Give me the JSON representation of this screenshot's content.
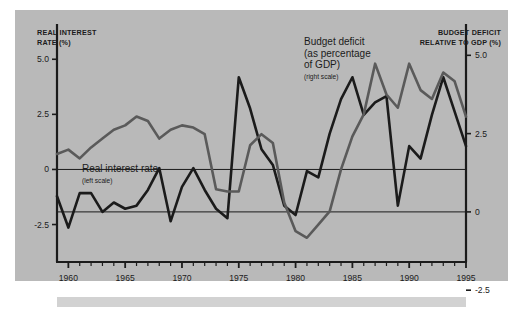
{
  "figure": {
    "background_color": "#b9b9b9",
    "page_color": "#ffffff",
    "underbar_color": "#d2d2d2"
  },
  "axis_titles": {
    "left": "REAL INTEREST\nRATE (%)",
    "right": "BUDGET DEFICIT\nRELATIVE TO GDP (%)"
  },
  "annotations": {
    "deficit": {
      "main": "Budget deficit\n(as percentage\nof GDP)",
      "sub": "(right scale)"
    },
    "interest": {
      "main": "Real interest rate",
      "sub": "(left scale)"
    }
  },
  "chart_data": {
    "type": "line",
    "title": "",
    "subtitle": "",
    "xlabel": "",
    "ylabel": "REAL INTEREST RATE (%)",
    "y2label": "BUDGET DEFICIT RELATIVE TO GDP (%)",
    "grid": false,
    "legend_position": "inline-annotations",
    "xlim": [
      1959,
      1995
    ],
    "xticks_major": [
      1960,
      1965,
      1970,
      1975,
      1980,
      1985,
      1990,
      1995
    ],
    "xtick_labels": [
      "1960",
      "1965",
      "1970",
      "1975",
      "1980",
      "1985",
      "1990",
      "1995"
    ],
    "xticks_minor_step": 1,
    "left_axis": {
      "label": "REAL INTEREST RATE (%)",
      "ticks": [
        5.0,
        2.5,
        0,
        -2.5
      ],
      "tick_labels": [
        "5.0",
        "2.5",
        "0",
        "-2.5"
      ],
      "ylim": [
        -4.2,
        6.6
      ],
      "color": "#5a5a5a"
    },
    "right_axis": {
      "label": "BUDGET DEFICIT RELATIVE TO GDP (%)",
      "ticks": [
        5.0,
        2.5,
        0,
        -2.5
      ],
      "tick_labels": [
        "5.0",
        "2.5",
        "0",
        "-2.5"
      ],
      "ylim": [
        -1.6,
        6.0
      ],
      "color": "#1b1b1b"
    },
    "x": [
      1959,
      1960,
      1961,
      1962,
      1963,
      1964,
      1965,
      1966,
      1967,
      1968,
      1969,
      1970,
      1971,
      1972,
      1973,
      1974,
      1975,
      1976,
      1977,
      1978,
      1979,
      1980,
      1981,
      1982,
      1983,
      1984,
      1985,
      1986,
      1987,
      1988,
      1989,
      1990,
      1991,
      1992,
      1993,
      1994,
      1995
    ],
    "series": [
      {
        "name": "Budget deficit (as percentage of GDP)",
        "axis": "right",
        "color": "#1b1b1b",
        "line_width": 2.6,
        "values": [
          0.5,
          -0.5,
          0.6,
          0.6,
          0.0,
          0.3,
          0.1,
          0.2,
          0.7,
          1.4,
          -0.3,
          0.8,
          1.4,
          0.7,
          0.1,
          -0.2,
          4.3,
          3.3,
          2.0,
          1.5,
          0.2,
          -0.1,
          1.3,
          1.1,
          2.5,
          3.6,
          4.3,
          3.1,
          3.5,
          3.7,
          0.2,
          2.1,
          1.7,
          3.1,
          4.3,
          3.2,
          2.1
        ]
      },
      {
        "name": "Real interest rate",
        "axis": "left",
        "color": "#5a5a5a",
        "line_width": 2.6,
        "values": [
          0.7,
          0.9,
          0.5,
          1.0,
          1.4,
          1.8,
          2.0,
          2.4,
          2.2,
          1.4,
          1.8,
          2.0,
          1.9,
          1.6,
          -0.9,
          -1.0,
          -1.0,
          1.1,
          1.6,
          1.2,
          -1.5,
          -2.8,
          -3.1,
          -2.5,
          -1.9,
          0.0,
          1.5,
          2.5,
          4.8,
          3.4,
          2.8,
          4.8,
          3.6,
          3.2,
          4.4,
          4.0,
          2.4
        ]
      }
    ]
  }
}
